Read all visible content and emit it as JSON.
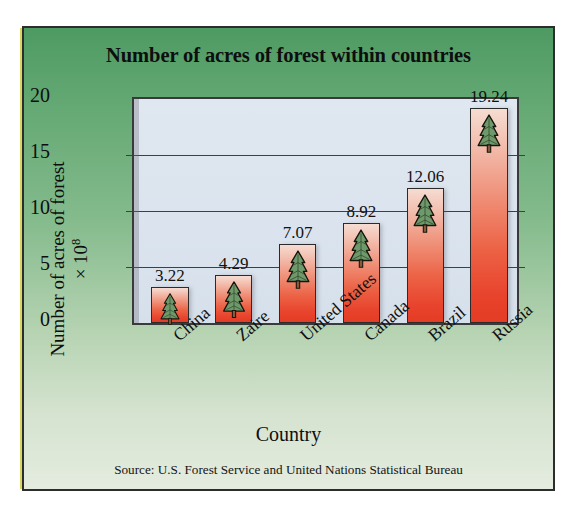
{
  "chart_data": {
    "type": "bar",
    "title": "Number of acres of forest within countries",
    "xlabel": "Country",
    "ylabel": "Number of acres of forest × 10⁸",
    "ylabel_line1": "Number of acres of forest",
    "ylabel_line2_prefix": "× 10",
    "ylabel_line2_exp": "8",
    "categories": [
      "China",
      "Zaire",
      "United States",
      "Canada",
      "Brazil",
      "Russia"
    ],
    "values": [
      3.22,
      4.29,
      7.07,
      8.92,
      12.06,
      19.24
    ],
    "value_labels": [
      "3.22",
      "4.29",
      "7.07",
      "8.92",
      "12.06",
      "19.24"
    ],
    "ylim": [
      0,
      20
    ],
    "yticks": [
      0,
      5,
      10,
      15,
      20
    ],
    "ytick_labels": [
      "0",
      "5",
      "10",
      "15",
      "20"
    ],
    "grid": true,
    "legend": false,
    "source": "Source: U.S. Forest Service and United Nations Statistical Bureau",
    "bar_icon": "pine-tree-icon",
    "colors": {
      "bar_top": "#f6dcd2",
      "bar_bottom": "#e43c25",
      "plot_background": "#dbe4ee",
      "figure_background_top": "#4e9a63",
      "figure_background_bottom": "#e4ecdf",
      "axis": "#3a3a3a",
      "text": "#0e0e0e",
      "tree_foliage": "#6e9a6b",
      "tree_trunk": "#8a5a38"
    }
  }
}
